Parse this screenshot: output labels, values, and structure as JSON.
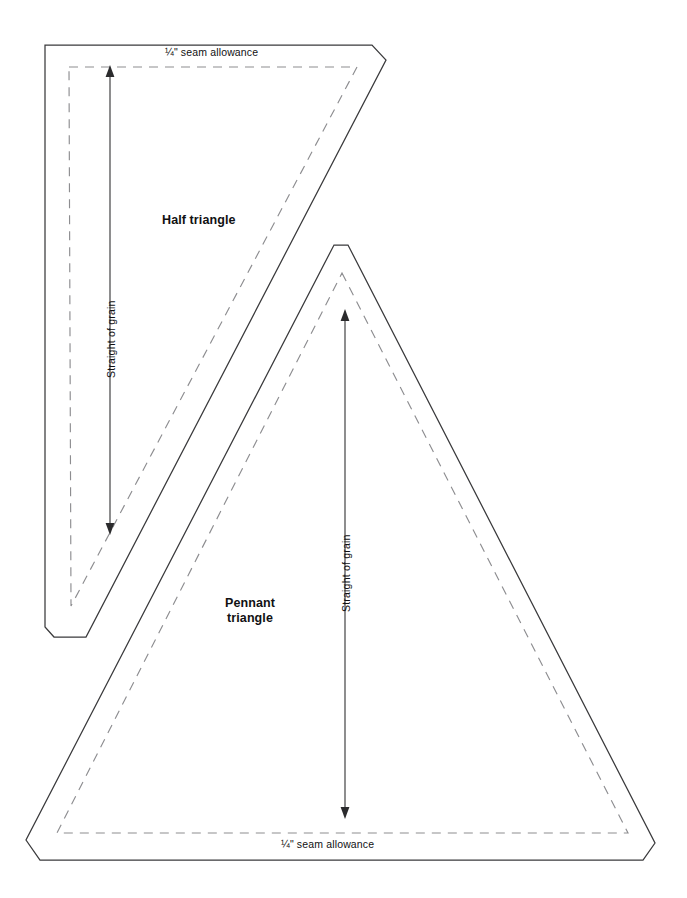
{
  "document": {
    "type": "sewing-pattern-template-sheet",
    "background_color": "#ffffff",
    "cut_line_color": "#3a3a3c",
    "sew_line_color": "#8d8d90",
    "text_color": "#111113"
  },
  "pieces": [
    {
      "id": "half-triangle",
      "name": "Half triangle",
      "seam_allowance_label": "¼\" seam allowance",
      "seam_allowance_position": "top",
      "grain_label": "Straight of grain",
      "grain_orientation": "vertical",
      "grain_arrow": "double-headed"
    },
    {
      "id": "pennant-triangle",
      "name_line_1": "Pennant",
      "name_line_2": "triangle",
      "seam_allowance_label": "¼\" seam allowance",
      "seam_allowance_position": "bottom",
      "grain_label": "Straight of grain",
      "grain_orientation": "vertical",
      "grain_arrow": "double-headed"
    }
  ],
  "labels": {
    "seam_allowance_top": "¼\" seam allowance",
    "seam_allowance_bottom": "¼\" seam allowance",
    "half_triangle_name": "Half triangle",
    "pennant_triangle_name_line_1": "Pennant",
    "pennant_triangle_name_line_2": "triangle",
    "grain_half_triangle": "Straight of grain",
    "grain_pennant_triangle": "Straight of grain"
  }
}
